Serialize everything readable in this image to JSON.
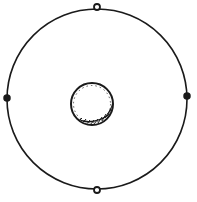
{
  "diagram": {
    "type": "concentric-circles",
    "colors": {
      "stroke": "#1a1a1a",
      "background": "#ffffff",
      "bead_fill": "#ffffff"
    },
    "outer_circle": {
      "cx": 97,
      "cy": 99,
      "r": 90
    },
    "inner_circle": {
      "cx": 92,
      "cy": 104,
      "r": 21,
      "shading": "hatched-lower-right"
    },
    "beads": [
      {
        "position": "top",
        "cx": 97,
        "cy": 7
      },
      {
        "position": "left",
        "cx": 7,
        "cy": 98
      },
      {
        "position": "right",
        "cx": 187,
        "cy": 96
      },
      {
        "position": "bottom",
        "cx": 97,
        "cy": 190
      }
    ]
  }
}
